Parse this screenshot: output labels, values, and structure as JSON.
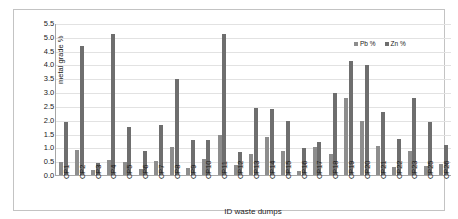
{
  "chart_data": {
    "type": "bar",
    "title": "",
    "subtitle": "",
    "xlabel": "ID waste dumps",
    "ylabel": "metal grade %",
    "ylim": [
      0.0,
      5.5
    ],
    "yticks": [
      "0.0",
      "0.5",
      "1.0",
      "1.5",
      "2.0",
      "2.5",
      "3.0",
      "3.5",
      "4.0",
      "4.5",
      "5.0",
      "5.5"
    ],
    "grid": true,
    "legend_position": "top-right",
    "categories": [
      "CP1",
      "CP2",
      "CP3",
      "CP4",
      "CP5",
      "CP6",
      "CP7",
      "CP8",
      "CP9",
      "CP10",
      "CP11",
      "CP12",
      "CP13",
      "CP14",
      "CP15",
      "CP16",
      "CP17",
      "CP18",
      "CP19",
      "CP20",
      "CP21",
      "CP22",
      "CP23",
      "CP25",
      "CP26"
    ],
    "series": [
      {
        "name": "Pb %",
        "color": "#8d8d8d",
        "values": [
          0.46,
          0.89,
          0.19,
          0.54,
          0.48,
          0.21,
          0.49,
          1.0,
          0.26,
          0.59,
          1.43,
          0.38,
          0.77,
          1.37,
          0.88,
          0.16,
          1.03,
          0.77,
          2.78,
          1.95,
          1.06,
          0.3,
          0.88,
          0.34,
          0.4
        ]
      },
      {
        "name": "Zn %",
        "color": "#6e6e6e",
        "values": [
          1.91,
          4.68,
          0.45,
          5.09,
          1.74,
          0.88,
          1.81,
          3.46,
          1.26,
          1.26,
          5.12,
          0.84,
          2.41,
          2.39,
          1.95,
          0.96,
          1.21,
          2.98,
          4.12,
          3.99,
          2.27,
          1.32,
          2.78,
          1.91,
          1.1
        ]
      }
    ]
  },
  "legend": {
    "entries": [
      {
        "label": "Pb %",
        "swatch": "pb"
      },
      {
        "label": "Zn %",
        "swatch": "zn"
      }
    ]
  },
  "axes": {
    "y_title": "metal grade %",
    "x_title": "ID waste dumps"
  }
}
